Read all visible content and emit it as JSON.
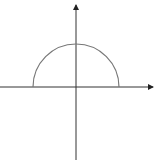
{
  "diagram": {
    "type": "semicircle-on-axes",
    "colors": {
      "background": "#ffffff",
      "axis": "#222222",
      "curve": "#777777"
    },
    "origin_px": [
      76,
      87
    ],
    "radius_px": 43,
    "x_axis": {
      "from_px": 0,
      "to_px": 155,
      "arrow": "right",
      "label": ""
    },
    "y_axis": {
      "from_px": 160,
      "to_px": 3,
      "arrow": "up",
      "label": ""
    }
  }
}
